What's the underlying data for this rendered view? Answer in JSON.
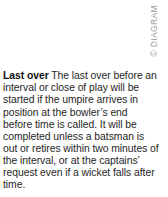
{
  "page": {
    "background_color": "#ffffff",
    "width": 168,
    "height": 197
  },
  "credit": {
    "text": "© DIAGRAM",
    "color": "#9a9a9a",
    "orientation": "vertical-bottom-to-top",
    "position": "top-right"
  },
  "entry": {
    "term": "Last over",
    "definition": " The last over before an interval or close of play will be started if the umpire arrives in position at the bowler’s end before time is called. It will be completed unless a batsman is out or retires within two minutes of the interval, or at the captains’ request even if a wicket falls after time.",
    "text_color": "#262626"
  }
}
